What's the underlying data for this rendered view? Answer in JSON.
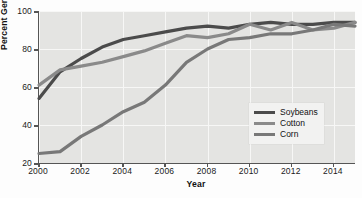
{
  "chart_data": {
    "type": "line",
    "title": "",
    "xlabel": "Year",
    "ylabel": "Percent Genetically Modified",
    "xlim": [
      2000,
      2015
    ],
    "ylim": [
      20,
      100
    ],
    "xticks": [
      2000,
      2002,
      2004,
      2006,
      2008,
      2010,
      2012,
      2014
    ],
    "xtick_labels": [
      "2000",
      "2002",
      "2004",
      "2006",
      "2008",
      "2010",
      "2012",
      "2014"
    ],
    "yticks": [
      20,
      40,
      60,
      80,
      100
    ],
    "ytick_labels": [
      "20",
      "40",
      "60",
      "80",
      "100"
    ],
    "grid": true,
    "legend_position": "center-right",
    "x": [
      2000,
      2001,
      2002,
      2003,
      2004,
      2005,
      2006,
      2007,
      2008,
      2009,
      2010,
      2011,
      2012,
      2013,
      2014,
      2015
    ],
    "series": [
      {
        "name": "Soybeans",
        "color": "#4b4b4b",
        "values": [
          54,
          68,
          75,
          81,
          85,
          87,
          89,
          91,
          92,
          91,
          93,
          94,
          93,
          93,
          94,
          94
        ]
      },
      {
        "name": "Cotton",
        "color": "#8a8a8a",
        "values": [
          61,
          69,
          71,
          73,
          76,
          79,
          83,
          87,
          86,
          88,
          93,
          90,
          94,
          90,
          91,
          94
        ]
      },
      {
        "name": "Corn",
        "color": "#787878",
        "values": [
          25,
          26,
          34,
          40,
          47,
          52,
          61,
          73,
          80,
          85,
          86,
          88,
          88,
          90,
          93,
          92
        ]
      }
    ]
  },
  "legend": {
    "items": [
      {
        "label": "Soybeans",
        "color": "#4b4b4b"
      },
      {
        "label": "Cotton",
        "color": "#8a8a8a"
      },
      {
        "label": "Corn",
        "color": "#787878"
      }
    ]
  },
  "style": {
    "plot_background": "#e4e4e2",
    "gridline_color": "#f7f7f6",
    "axis_color": "#555555",
    "page_background": "#fdfdfd"
  }
}
